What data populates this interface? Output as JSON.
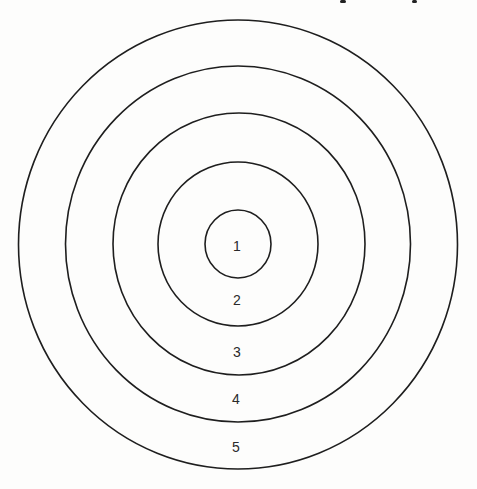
{
  "diagram": {
    "type": "concentric-circles",
    "center": {
      "x": 238,
      "y": 244
    },
    "stroke_color": "#1e1e1e",
    "rings": [
      {
        "zone": "1",
        "rx": 33,
        "ry": 34,
        "label_y": 245
      },
      {
        "zone": "2",
        "rx": 79,
        "ry": 82,
        "label_y": 300
      },
      {
        "zone": "3",
        "rx": 126,
        "ry": 131,
        "label_y": 352
      },
      {
        "zone": "4",
        "rx": 172,
        "ry": 178,
        "label_y": 398
      },
      {
        "zone": "5",
        "rx": 219,
        "ry": 225,
        "label_y": 446
      }
    ]
  },
  "labels": {
    "zone_1": "1",
    "zone_2": "2",
    "zone_3": "3",
    "zone_4": "4",
    "zone_5": "5"
  }
}
